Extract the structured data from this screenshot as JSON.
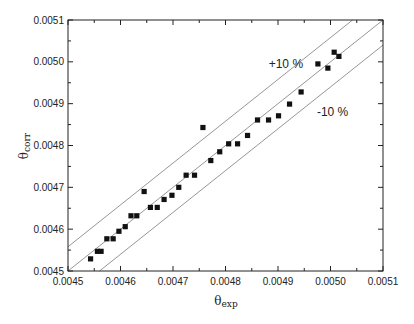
{
  "chart_data": {
    "type": "scatter",
    "title": "",
    "xlabel": "θexp",
    "xlabel_main": "θ",
    "xlabel_sub": "exp",
    "ylabel": "θcorr",
    "ylabel_main": "θ",
    "ylabel_sub": "corr",
    "xlim": [
      0.0045,
      0.0051
    ],
    "ylim": [
      0.0045,
      0.0051
    ],
    "x_ticks": [
      "0.0045",
      "0.0046",
      "0.0047",
      "0.0048",
      "0.0049",
      "0.0050",
      "0.0051"
    ],
    "y_ticks": [
      "0.0045",
      "0.0046",
      "0.0047",
      "0.0048",
      "0.0049",
      "0.0050",
      "0.0051"
    ],
    "grid": false,
    "legend": null,
    "marker": "square",
    "marker_color": "#111111",
    "line_color": "#8a8a8a",
    "series": [
      {
        "name": "data",
        "x": [
          0.004543,
          0.004556,
          0.004563,
          0.004574,
          0.004586,
          0.004597,
          0.004609,
          0.00462,
          0.004631,
          0.004645,
          0.004657,
          0.00467,
          0.004683,
          0.004698,
          0.004711,
          0.004725,
          0.004741,
          0.004757,
          0.004772,
          0.004789,
          0.004806,
          0.004823,
          0.004842,
          0.004861,
          0.004882,
          0.004901,
          0.004922,
          0.004944,
          0.004976,
          0.004995,
          0.005007,
          0.005016
        ],
        "y": [
          0.004529,
          0.004547,
          0.004547,
          0.004577,
          0.004577,
          0.004595,
          0.004606,
          0.004632,
          0.004632,
          0.00469,
          0.004652,
          0.004652,
          0.004671,
          0.004681,
          0.0047,
          0.004729,
          0.004729,
          0.004843,
          0.004764,
          0.004785,
          0.004804,
          0.004804,
          0.004824,
          0.004861,
          0.004861,
          0.004871,
          0.004899,
          0.004928,
          0.004995,
          0.004985,
          0.005023,
          0.005013
        ]
      }
    ],
    "reference_lines": [
      {
        "name": "y = x",
        "offset": 0.0
      },
      {
        "name": "+10 %",
        "offset": 5.8e-05
      },
      {
        "name": "-10 %",
        "offset": -6e-05
      }
    ],
    "annotations": [
      {
        "text": "+10 %",
        "x": 0.004915,
        "y": 0.004985
      },
      {
        "text": "-10 %",
        "x": 0.005004,
        "y": 0.00487
      }
    ]
  }
}
